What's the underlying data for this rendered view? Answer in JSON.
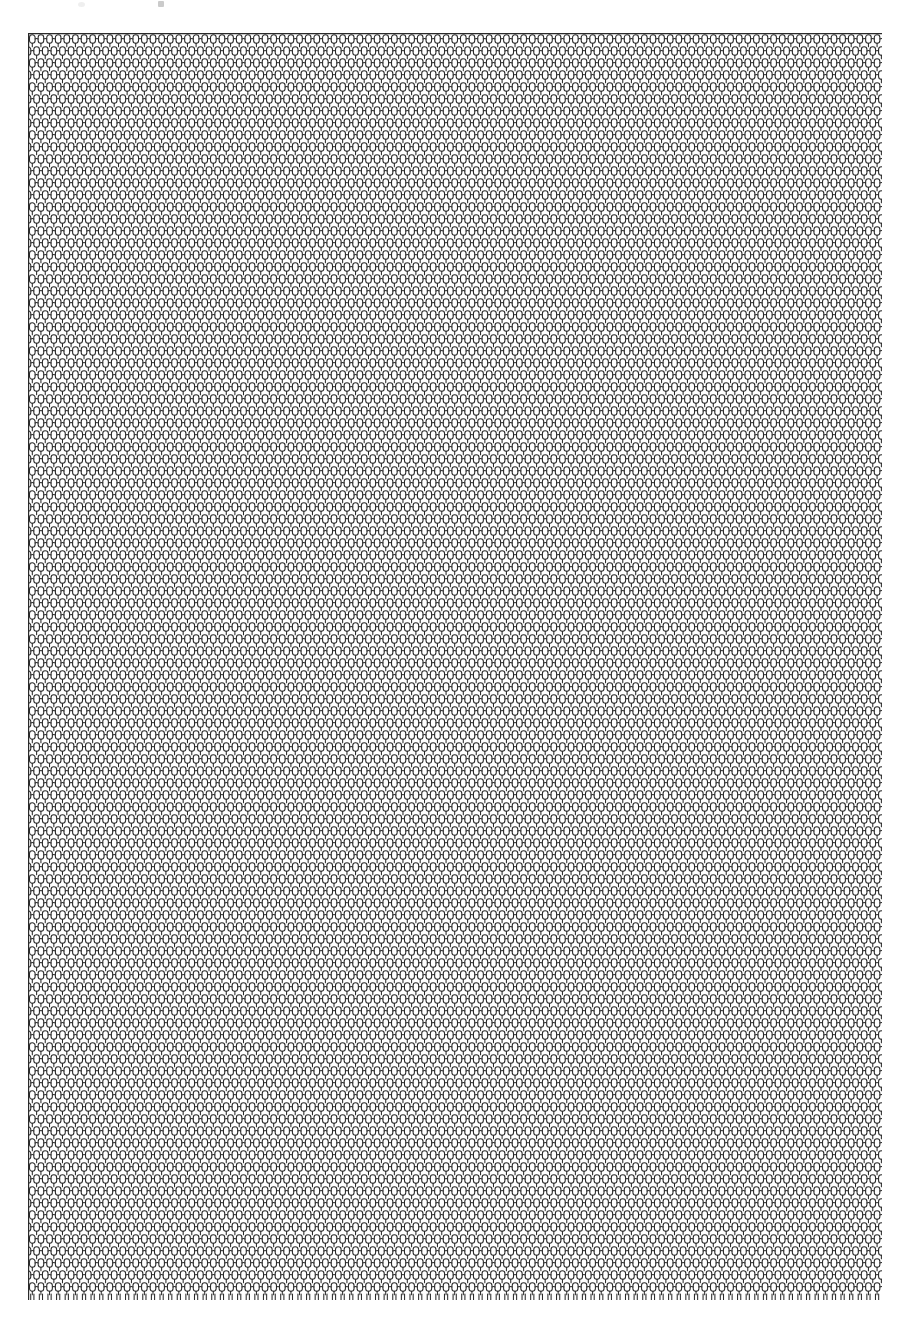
{
  "document": {
    "kind": "scanned-textile-swatch",
    "background_color": "#ffffff",
    "width": 905,
    "height": 1317,
    "visible_text": "",
    "caption": ""
  },
  "swatch": {
    "name": "mesh-fabric-swatch",
    "description": "knitted open mesh netting",
    "left": 28,
    "top": 33,
    "width": 854,
    "height": 1267,
    "line_color": "#2a2a2a",
    "hole_color": "#ffffff",
    "stroke_width": 1.05,
    "cell_width": 8.62,
    "cell_height": 12.0,
    "columns": 99,
    "rows": 105,
    "loop_body_width": 5.6,
    "loop_body_height": 8.4,
    "loop_corner_radius": 2.8,
    "edges": {
      "top_binding_line": true,
      "left_selvage_line": true,
      "right_cut_edge": true,
      "bottom_prongs": true,
      "bottom_prong_length": 6
    }
  },
  "artifacts": {
    "specks": [
      {
        "name": "scan-speck-left",
        "x": 78,
        "y": 2,
        "color": "#e9e9e9"
      },
      {
        "name": "scan-speck-right",
        "x": 158,
        "y": 1,
        "color": "#b9b9b9"
      }
    ]
  }
}
